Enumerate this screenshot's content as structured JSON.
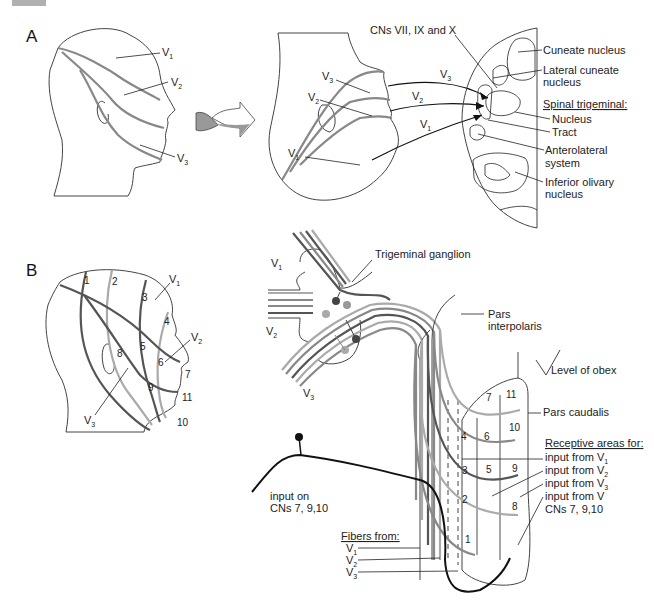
{
  "header_tab": {
    "color": "#b0b0b0"
  },
  "panel_a": {
    "label": "A",
    "head_labels": {
      "v1": "V",
      "v1_sub": "1",
      "v2": "V",
      "v2_sub": "2",
      "v3": "V",
      "v3_sub": "3"
    },
    "face_labels": {
      "v3": "V",
      "v3_sub": "3",
      "v2": "V",
      "v2_sub": "2",
      "v1": "V",
      "v1_sub": "1"
    },
    "arrow_labels": {
      "v3": "V",
      "v3_sub": "3",
      "v2": "V",
      "v2_sub": "2",
      "v1": "V",
      "v1_sub": "1"
    },
    "cns_label": "CNs VII, IX and X",
    "medulla_labels": {
      "cuneate": "Cuneate nucleus",
      "lateral_cuneate_1": "Lateral cuneate",
      "lateral_cuneate_2": "nucleus",
      "spinal_trigeminal": "Spinal trigeminal:",
      "nucleus": "Nucleus",
      "tract": "Tract",
      "anterolateral_1": "Anterolateral",
      "anterolateral_2": "system",
      "olivary_1": "Inferior olivary",
      "olivary_2": "nucleus"
    }
  },
  "panel_b": {
    "label": "B",
    "head_numbers": [
      "1",
      "2",
      "3",
      "4",
      "5",
      "6",
      "7",
      "8",
      "9",
      "10",
      "11"
    ],
    "head_labels": {
      "v1": "V",
      "v1_sub": "1",
      "v2": "V",
      "v2_sub": "2",
      "v3": "V",
      "v3_sub": "3"
    },
    "ganglion_label": "Trigeminal ganglion",
    "nerve_labels": {
      "v1": "V",
      "v1_sub": "1",
      "v2": "V",
      "v2_sub": "2",
      "v3": "V",
      "v3_sub": "3"
    },
    "pars_interpolaris_1": "Pars",
    "pars_interpolaris_2": "interpolaris",
    "obex": "Level of obex",
    "pars_caudalis": "Pars caudalis",
    "receptive_title": "Receptive areas for:",
    "receptive_items": [
      {
        "text": "input from V",
        "sub": "1"
      },
      {
        "text": "input from V",
        "sub": "2"
      },
      {
        "text": "input from V",
        "sub": "3"
      },
      {
        "text": "input from V",
        "sub": ""
      }
    ],
    "receptive_extra": "CNs 7, 9,10",
    "caudalis_numbers": [
      "7",
      "11",
      "4",
      "6",
      "10",
      "3",
      "5",
      "9",
      "2",
      "8",
      "1"
    ],
    "input_on_1": "input on",
    "input_on_2": "CNs 7, 9,10",
    "fibers_title": "Fibers from:",
    "fibers": [
      {
        "text": "V",
        "sub": "1"
      },
      {
        "text": "V",
        "sub": "2"
      },
      {
        "text": "V",
        "sub": "3"
      }
    ]
  },
  "colors": {
    "v1_fiber": "#aaaaaa",
    "v2_fiber": "#888888",
    "v3_fiber": "#555555",
    "cn_fiber": "#111111"
  }
}
